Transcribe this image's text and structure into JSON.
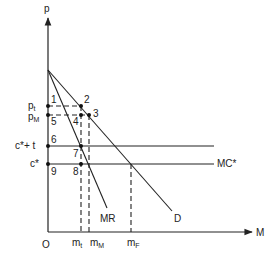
{
  "diagram": {
    "type": "monopoly-tariff-quota-economics-diagram",
    "axes": {
      "y_label": "p",
      "x_label": "M",
      "origin_label": "O"
    },
    "price_levels": [
      {
        "id": "p_t",
        "label_main": "p",
        "label_sub": "t"
      },
      {
        "id": "p_M",
        "label_main": "p",
        "label_sub": "M"
      },
      {
        "id": "c_star_plus_t",
        "label": "c*+ t"
      },
      {
        "id": "c_star",
        "label": "c*"
      }
    ],
    "quantity_levels": [
      {
        "id": "m_t",
        "label_main": "m",
        "label_sub": "t"
      },
      {
        "id": "m_M",
        "label_main": "m",
        "label_sub": "M"
      },
      {
        "id": "m_F",
        "label_main": "m",
        "label_sub": "F"
      }
    ],
    "curves": {
      "mr": "MR",
      "d": "D",
      "mc": "MC*"
    },
    "points": [
      "1",
      "2",
      "3",
      "4",
      "5",
      "6",
      "7",
      "8",
      "9"
    ],
    "colors": {
      "ink": "#222222",
      "background": "#ffffff"
    }
  }
}
